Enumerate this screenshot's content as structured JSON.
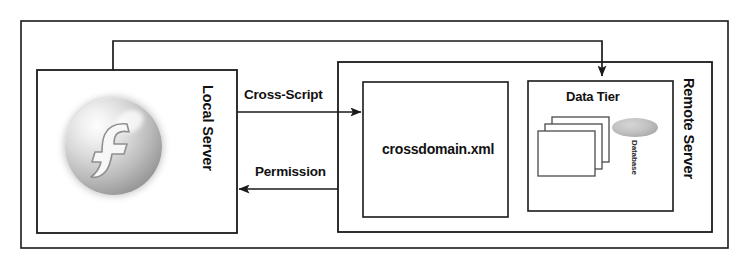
{
  "diagram": {
    "outer_frame": {
      "name": "system-boundary"
    },
    "nodes": [
      {
        "id": "local-server",
        "label": "Local Server",
        "orientation": "vertical"
      },
      {
        "id": "remote-server",
        "label": "Remote Server",
        "orientation": "vertical"
      },
      {
        "id": "crossdomain",
        "label": "crossdomain.xml",
        "orientation": "horizontal"
      },
      {
        "id": "data-tier",
        "label": "Data Tier",
        "orientation": "horizontal"
      },
      {
        "id": "database",
        "label": "Database",
        "orientation": "vertical"
      }
    ],
    "edges": [
      {
        "id": "cross-script",
        "label": "Cross-Script",
        "from": "local-server",
        "to": "crossdomain",
        "direction": "right"
      },
      {
        "id": "permission",
        "label": "Permission",
        "from": "crossdomain",
        "to": "local-server",
        "direction": "left"
      },
      {
        "id": "data-request",
        "label": "",
        "from": "local-server",
        "to": "data-tier",
        "direction": "down"
      }
    ],
    "icons": {
      "flash_logo": "flash-player-logo-icon",
      "documents_stack": "documents-stack-icon",
      "database_cylinder": "database-cylinder-icon"
    },
    "colors": {
      "stroke": "#1a1a1a",
      "background": "#ffffff",
      "logo_grey": "#b8b8b8",
      "db_grey": "#c2c2c2"
    }
  }
}
